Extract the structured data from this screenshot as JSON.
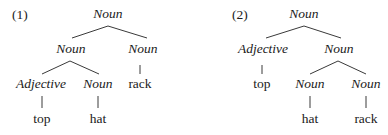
{
  "trees": [
    {
      "label": "(1)",
      "nodes": {
        "root": "Noun",
        "left": "Noun",
        "right": "Noun",
        "left_left": "Adjective",
        "left_right": "Noun",
        "right_word": "rack",
        "left_left_word": "top",
        "left_right_word": "hat"
      }
    },
    {
      "label": "(2)",
      "nodes": {
        "root": "Noun",
        "left": "Adjective",
        "right": "Noun",
        "left_word": "top",
        "right_left": "Noun",
        "right_right": "Noun",
        "right_left_word": "hat",
        "right_right_word": "rack"
      }
    }
  ]
}
